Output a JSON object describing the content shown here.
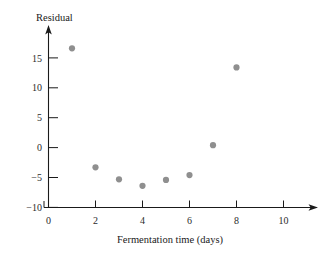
{
  "chart_data": {
    "type": "scatter",
    "title": "",
    "xlabel": "Fermentation time (days)",
    "ylabel": "Residual",
    "x": [
      1,
      2,
      3,
      4,
      5,
      6,
      7,
      8
    ],
    "values": [
      16.6,
      -3.3,
      -5.3,
      -6.4,
      -5.4,
      -4.6,
      0.4,
      13.4
    ],
    "series": [
      {
        "name": "Residual",
        "points": [
          {
            "x": 1,
            "y": 16.6
          },
          {
            "x": 2,
            "y": -3.3
          },
          {
            "x": 3,
            "y": -5.3
          },
          {
            "x": 4,
            "y": -6.4
          },
          {
            "x": 5,
            "y": -5.4
          },
          {
            "x": 6,
            "y": -4.6
          },
          {
            "x": 7,
            "y": 0.4
          },
          {
            "x": 8,
            "y": 13.4
          }
        ]
      }
    ],
    "xlim": [
      0,
      11
    ],
    "ylim": [
      -10,
      18
    ],
    "xticks": [
      0,
      2,
      4,
      6,
      8,
      10
    ],
    "xtick_labels": [
      "0",
      "2",
      "4",
      "6",
      "8",
      "10"
    ],
    "yticks": [
      15,
      10,
      5,
      0,
      -5,
      -10
    ],
    "ytick_labels": [
      "15",
      "10",
      "5",
      "0",
      "−5",
      "−10"
    ],
    "grid": false,
    "legend": null,
    "marker_color": "#8f8f8f",
    "axis_color": "#1a1a1a"
  },
  "axes": {
    "y_axis_title": "Residual",
    "x_axis_title": "Fermentation time (days)"
  },
  "ticks": {
    "y": [
      {
        "label": "15"
      },
      {
        "label": "10"
      },
      {
        "label": "5"
      },
      {
        "label": "0"
      },
      {
        "label": "−5"
      },
      {
        "label": "−10"
      }
    ],
    "x": [
      {
        "label": "0"
      },
      {
        "label": "2"
      },
      {
        "label": "4"
      },
      {
        "label": "6"
      },
      {
        "label": "8"
      },
      {
        "label": "10"
      }
    ]
  }
}
